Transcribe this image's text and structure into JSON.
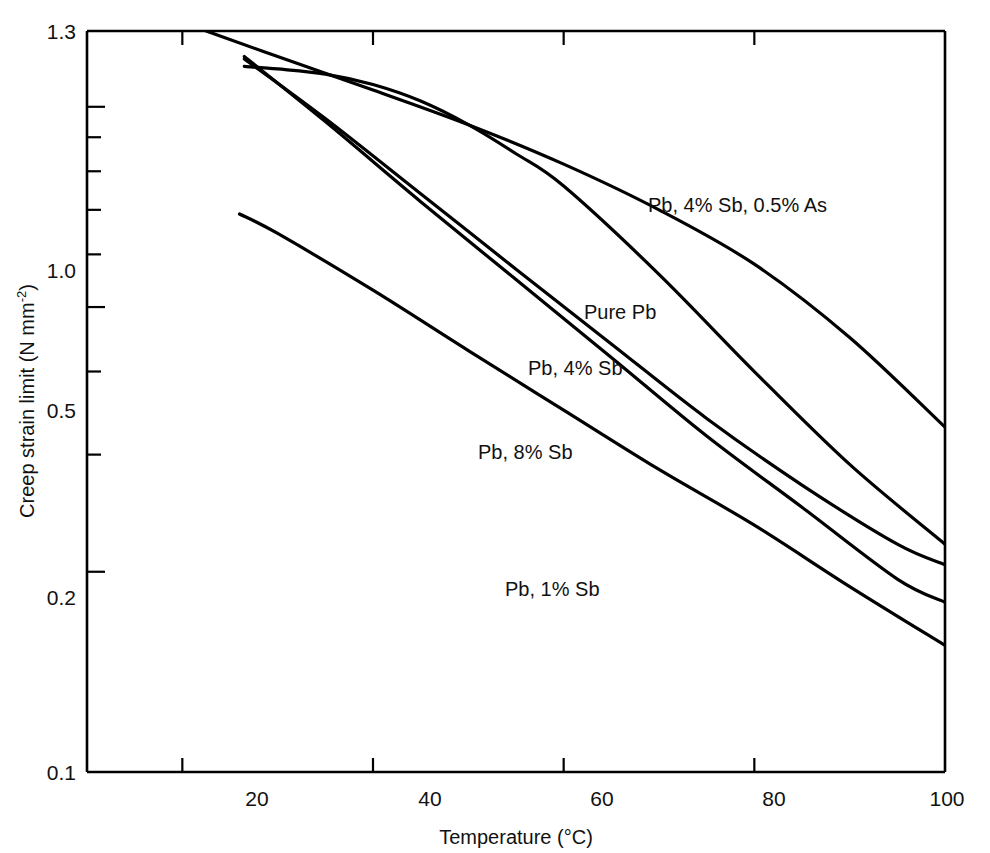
{
  "chart_data": {
    "type": "line",
    "title": "",
    "xlabel": "Temperature (°C)",
    "ylabel": "Creep strain limit (N mm⁻²)",
    "ylabel_main": "Creep strain limit (N mm",
    "ylabel_sup": "-2",
    "ylabel_tail": ")",
    "xscale": "linear",
    "yscale": "log",
    "xlim": [
      10,
      100
    ],
    "ylim": [
      0.1,
      1.3
    ],
    "grid": false,
    "legend": "inline-curve-labels",
    "xticks": [
      20,
      40,
      60,
      80,
      100
    ],
    "xtick_labels": [
      "20",
      "40",
      "60",
      "80",
      "100"
    ],
    "yticks_major": [
      1.3,
      1.0,
      0.5,
      0.2,
      0.1
    ],
    "ytick_labels": [
      "1.3",
      "1.0",
      "0.5",
      "0.2",
      "0.1"
    ],
    "yticks_minor": [
      0.9,
      0.8,
      0.7,
      0.6,
      0.4,
      0.3
    ],
    "series": [
      {
        "name": "Pb, 4% Sb, 0.5% As",
        "label_x": 73,
        "label_y": 1.12,
        "x": [
          22.5,
          30,
          40,
          50,
          60,
          70,
          80,
          90,
          100
        ],
        "y": [
          1.3,
          1.19,
          1.06,
          0.94,
          0.82,
          0.7,
          0.58,
          0.45,
          0.33
        ]
      },
      {
        "name": "Pure Pb",
        "label_x": 66,
        "label_y": 0.78,
        "x": [
          26.5,
          30,
          35,
          40,
          45,
          50,
          55,
          60,
          70,
          80,
          90,
          100
        ],
        "y": [
          1.15,
          1.14,
          1.12,
          1.08,
          1.02,
          0.94,
          0.85,
          0.76,
          0.56,
          0.4,
          0.29,
          0.22
        ]
      },
      {
        "name": "Pb, 4% Sb",
        "label_x": 61,
        "label_y": 0.64,
        "x": [
          26.5,
          35,
          45,
          55,
          65,
          75,
          85,
          95,
          100
        ],
        "y": [
          1.18,
          0.96,
          0.74,
          0.57,
          0.44,
          0.34,
          0.27,
          0.22,
          0.205
        ]
      },
      {
        "name": "Pb, 8% Sb",
        "label_x": 55,
        "label_y": 0.44,
        "x": [
          26.5,
          35,
          45,
          55,
          65,
          75,
          85,
          95,
          100
        ],
        "y": [
          1.19,
          0.95,
          0.72,
          0.55,
          0.42,
          0.32,
          0.25,
          0.195,
          0.18
        ]
      },
      {
        "name": "Pb, 1% Sb",
        "label_x": 58,
        "label_y": 0.225,
        "x": [
          26,
          30,
          40,
          50,
          60,
          70,
          80,
          90,
          100
        ],
        "y": [
          0.69,
          0.645,
          0.53,
          0.43,
          0.35,
          0.285,
          0.235,
          0.19,
          0.155
        ]
      }
    ]
  },
  "axes": {
    "x_title": "Temperature (°C)",
    "y_title_main": "Creep strain limit (N mm",
    "y_title_sup": "-2",
    "y_title_tail": ")"
  },
  "xtick_0": "20",
  "xtick_1": "40",
  "xtick_2": "60",
  "xtick_3": "80",
  "xtick_4": "100",
  "ytick_0": "1.3",
  "ytick_1": "1.0",
  "ytick_2": "0.5",
  "ytick_3": "0.2",
  "ytick_4": "0.1",
  "label_0": "Pb, 4% Sb, 0.5% As",
  "label_1": "Pure Pb",
  "label_2": "Pb, 4% Sb",
  "label_3": "Pb, 8% Sb",
  "label_4": "Pb, 1% Sb"
}
